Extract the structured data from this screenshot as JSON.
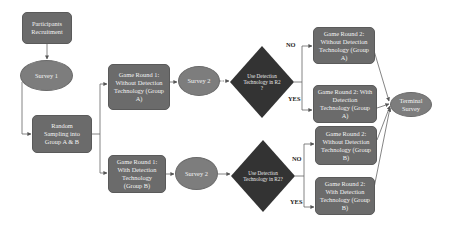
{
  "diagram": {
    "nodes": {
      "recruitment": "Participants Recruitment",
      "survey1": "Survey 1",
      "random_sampling": "Random Sampling into Group A & B",
      "gr1_a": "Game Round 1: Without Detection Technology (Group A)",
      "gr1_b": "Game Round 1: With Detection Technology (Group B)",
      "survey2_a": "Survey 2",
      "survey2_b": "Survey 2",
      "decision_a": "Use Detection Technology in R2 ?",
      "decision_b": "Use Detection Technology in R2?",
      "gr2_a_without": "Game Round 2: Without Detection Technology (Group A)",
      "gr2_a_with": "Game Round 2: With Detection Technology (Group A)",
      "gr2_b_without": "Game Round 2: Without Detection Technology (Group B)",
      "gr2_b_with": "Game Round 2: With Detection Technology (Group B)",
      "terminal": "Terminal Survey"
    },
    "edge_labels": {
      "a_no": "NO",
      "a_yes": "YES",
      "b_no": "NO",
      "b_yes": "YES"
    },
    "colors": {
      "box_fill": "#6b6b6b",
      "ellipse_fill": "#7d7d7d",
      "diamond_fill": "#333333",
      "edge": "#555555",
      "text": "#f2f2f2"
    }
  }
}
